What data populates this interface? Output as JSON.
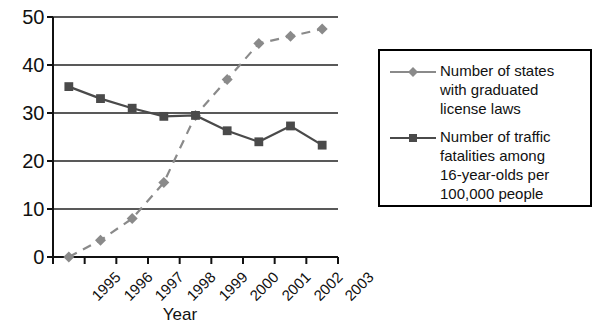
{
  "chart_data": {
    "type": "line",
    "title": "",
    "subtitle": "",
    "xlabel": "Year",
    "ylabel": "",
    "categories": [
      "1995",
      "1996",
      "1997",
      "1998",
      "1999",
      "2000",
      "2001",
      "2002",
      "2003"
    ],
    "ylim": [
      0,
      50
    ],
    "yticks": [
      0,
      10,
      20,
      30,
      40,
      50
    ],
    "ytick_labels": [
      "0",
      "10",
      "20",
      "30",
      "40",
      "50"
    ],
    "grid": "horizontal",
    "legend_position": "right-outside",
    "series": [
      {
        "name": "Number of states with graduated license laws",
        "marker": "diamond",
        "linestyle": "dashed",
        "color": "#8a8a8a",
        "values": [
          0,
          3.5,
          8,
          15.5,
          29.5,
          37,
          44.5,
          46,
          47.5
        ]
      },
      {
        "name": "Number of traffic fatalities among 16-year-olds per 100,000 people",
        "marker": "square",
        "linestyle": "solid",
        "color": "#4a4a4a",
        "values": [
          35.5,
          33,
          31,
          29.3,
          29.5,
          26.3,
          24,
          27.3,
          23.3
        ]
      }
    ],
    "annotations": []
  },
  "axes": {
    "x_title": "Year",
    "y_tick_labels": [
      "50",
      "40",
      "30",
      "20",
      "10",
      "0"
    ],
    "x_tick_labels": [
      "1995",
      "1996",
      "1997",
      "1998",
      "1999",
      "2000",
      "2001",
      "2002",
      "2003"
    ]
  },
  "legend": {
    "entries": [
      {
        "label": "Number of states\nwith graduated\nlicense laws",
        "marker": "diamond",
        "color": "#8a8a8a"
      },
      {
        "label": "Number of traffic\nfatalities among\n16-year-olds per\n100,000 people",
        "marker": "square",
        "color": "#4a4a4a"
      }
    ]
  },
  "colors": {
    "states_series": "#8a8a8a",
    "fatalities_series": "#4a4a4a",
    "axis": "#111111",
    "grid": "#222222",
    "legend_border": "#000000",
    "background": "#ffffff"
  }
}
